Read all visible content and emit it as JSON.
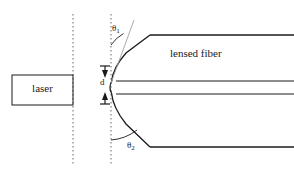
{
  "figure": {
    "type": "optical-schematic",
    "background_color": "#ffffff",
    "line_color": "#1a1a1a",
    "dotted_line_color": "#666666",
    "guide_line_color": "#a0a0a0",
    "width": 294,
    "height": 176
  },
  "labels": {
    "laser": "laser",
    "lensed_fiber": "lensed fiber",
    "distance": "d",
    "theta1_symbol": "θ",
    "theta1_subscript": "1",
    "theta2_symbol": "θ",
    "theta2_subscript": "2"
  },
  "elements": {
    "laser_box": {
      "name": "laser",
      "x": 12,
      "y": 75,
      "width": 61,
      "height": 30
    },
    "dotted_line_left": {
      "name": "laser-facet-reference-line",
      "x": 73,
      "y_top": 14,
      "y_bottom": 166
    },
    "dotted_line_right": {
      "name": "fiber-tip-reference-line",
      "x": 111,
      "y_top": 14,
      "y_bottom": 166
    },
    "fiber_top_edge_y": 35,
    "fiber_bottom_edge_y": 147,
    "fiber_core_top_y": 81,
    "fiber_core_bottom_y": 94,
    "fiber_taper_corner_x": 150,
    "fiber_tip_x": 111,
    "fiber_right_edge_x": 294,
    "gap_distance_arrow_x": 105,
    "gap_top_y": 69,
    "gap_bottom_y": 101
  },
  "angles": {
    "theta1": {
      "name": "upper-taper-angle",
      "vertex_x": 111,
      "vertex_y": 83,
      "measured_from": "vertical-reference-line",
      "measured_to": "upper-taper-guide-line"
    },
    "theta2": {
      "name": "lower-taper-angle",
      "vertex_x": 111,
      "vertex_y": 92,
      "measured_from": "vertical-reference-line",
      "measured_to": "lower-taper-line"
    }
  }
}
